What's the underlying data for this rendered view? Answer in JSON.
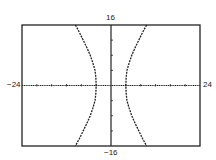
{
  "chart_data": {
    "type": "line",
    "title": "",
    "xlabel": "",
    "ylabel": "",
    "equation": "x^2/16 - y^2/56 = 1",
    "xlim": [
      -24,
      24
    ],
    "ylim": [
      -16,
      16
    ],
    "tick_labels": {
      "xmin": "−24",
      "xmax": "24",
      "ymin": "−16",
      "ymax": "16"
    },
    "x_tick_step": 4,
    "y_tick_step": 4,
    "grid": false,
    "legend": null,
    "curve_style": "dotted",
    "series": [
      {
        "name": "right-branch",
        "points": [
          [
            9.6,
            16
          ],
          [
            8.5,
            14
          ],
          [
            7.5,
            12
          ],
          [
            6.5,
            10
          ],
          [
            5.6,
            8
          ],
          [
            4.9,
            6
          ],
          [
            4.3,
            4
          ],
          [
            4.08,
            2
          ],
          [
            4,
            0
          ],
          [
            4.08,
            -2
          ],
          [
            4.3,
            -4
          ],
          [
            4.9,
            -6
          ],
          [
            5.6,
            -8
          ],
          [
            6.5,
            -10
          ],
          [
            7.5,
            -12
          ],
          [
            8.5,
            -14
          ],
          [
            9.6,
            -16
          ]
        ]
      },
      {
        "name": "left-branch",
        "points": [
          [
            -9.6,
            16
          ],
          [
            -8.5,
            14
          ],
          [
            -7.5,
            12
          ],
          [
            -6.5,
            10
          ],
          [
            -5.6,
            8
          ],
          [
            -4.9,
            6
          ],
          [
            -4.3,
            4
          ],
          [
            -4.08,
            2
          ],
          [
            -4,
            0
          ],
          [
            -4.08,
            -2
          ],
          [
            -4.3,
            -4
          ],
          [
            -4.9,
            -6
          ],
          [
            -5.6,
            -8
          ],
          [
            -6.5,
            -10
          ],
          [
            -7.5,
            -12
          ],
          [
            -8.5,
            -14
          ],
          [
            -9.6,
            -16
          ]
        ]
      }
    ]
  },
  "layout": {
    "frame": {
      "left": 22,
      "top": 25,
      "right": 200,
      "bottom": 146
    },
    "colors": {
      "ink": "#222222",
      "background": "#ffffff"
    }
  }
}
